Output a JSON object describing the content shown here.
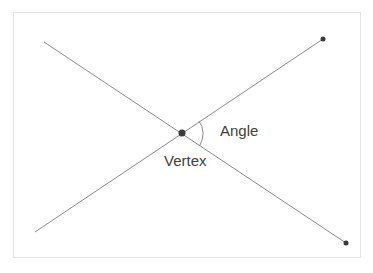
{
  "diagram": {
    "title": "Angle",
    "labels": {
      "angle": "Angle",
      "vertex": "Vertex"
    },
    "colors": {
      "line": "#8a8a8a",
      "point": "#3a3a3a",
      "text": "#404040",
      "border": "#e4e4e4"
    },
    "vertex": {
      "x": 182,
      "y": 133
    },
    "ray1": {
      "from": [
        182,
        133
      ],
      "to": [
        323,
        39
      ]
    },
    "ray2": {
      "from": [
        182,
        133
      ],
      "to": [
        346,
        243
      ]
    },
    "line1_extension_start": [
      35,
      232
    ],
    "line2_extension_start": [
      44,
      42
    ]
  }
}
